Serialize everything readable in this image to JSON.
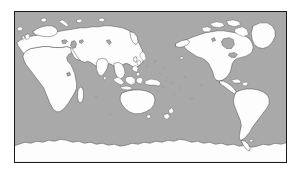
{
  "figure": {
    "kind": "world-map",
    "title": "",
    "background_color": "#ffffff",
    "frame_color": "#1a1a1a",
    "ocean_color": "#a9a9a9",
    "land_color": "#fdfdfd",
    "coastline_color": "#3c3c3c",
    "projection": "equirectangular",
    "center_longitude": "160E",
    "graticule": "none",
    "labels": "none"
  },
  "map": {
    "frame": {
      "x": 14,
      "y": 11,
      "width": 273,
      "height": 152
    },
    "landmasses": [
      {
        "name": "africa"
      },
      {
        "name": "madagascar"
      },
      {
        "name": "eurasia"
      },
      {
        "name": "europe-scandinavia"
      },
      {
        "name": "arabia"
      },
      {
        "name": "india"
      },
      {
        "name": "southeast-asia"
      },
      {
        "name": "indonesia"
      },
      {
        "name": "philippines"
      },
      {
        "name": "japan"
      },
      {
        "name": "australia"
      },
      {
        "name": "new-zealand"
      },
      {
        "name": "new-guinea"
      },
      {
        "name": "north-america"
      },
      {
        "name": "greenland"
      },
      {
        "name": "central-america"
      },
      {
        "name": "caribbean"
      },
      {
        "name": "south-america"
      },
      {
        "name": "antarctica"
      },
      {
        "name": "iceland"
      },
      {
        "name": "british-isles"
      },
      {
        "name": "svalbard"
      },
      {
        "name": "novaya-zemlya"
      },
      {
        "name": "canadian-arctic"
      },
      {
        "name": "pacific-islands"
      }
    ],
    "inland_waters": [
      {
        "name": "caspian-sea"
      },
      {
        "name": "black-sea"
      },
      {
        "name": "great-lakes"
      },
      {
        "name": "lake-victoria"
      },
      {
        "name": "hudson-bay"
      },
      {
        "name": "lake-baikal"
      }
    ]
  }
}
